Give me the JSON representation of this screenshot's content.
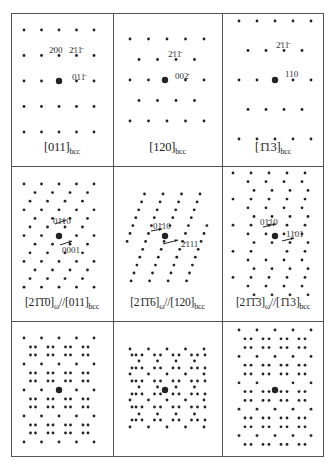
{
  "figure": {
    "frame": {
      "left": 11,
      "top": 13,
      "width": 313,
      "height": 444
    },
    "col_dividers": [
      102,
      211
    ],
    "row_dividers": [
      153,
      308
    ],
    "colors": {
      "spot": "#222222",
      "frame": "#555555",
      "text": "#222222"
    }
  },
  "panels": [
    {
      "id": "a",
      "row": 0,
      "col": 0,
      "caption": {
        "parts": [
          {
            "t": "[011]"
          },
          {
            "t": "bcc",
            "sub": true
          }
        ]
      },
      "caption_text": "[011]bcc",
      "center": [
        63,
        100
      ],
      "labels": [
        {
          "text": "2̄00",
          "x": 49,
          "y": 53
        },
        {
          "text": "2̄11̄",
          "x": 69,
          "y": 53
        },
        {
          "text": "011̄",
          "x": 72,
          "y": 80
        }
      ]
    },
    {
      "id": "b",
      "row": 0,
      "col": 1,
      "caption": {
        "parts": [
          {
            "t": "[120]"
          },
          {
            "t": "bcc",
            "sub": true
          }
        ]
      },
      "caption_text": "[120]bcc",
      "center": [
        165,
        80
      ],
      "labels": [
        {
          "text": "2̄11̄",
          "x": 168,
          "y": 57
        },
        {
          "text": "002̄",
          "x": 175,
          "y": 79
        }
      ]
    },
    {
      "id": "c",
      "row": 0,
      "col": 2,
      "caption": {
        "parts": [
          {
            "t": "[1̄13]"
          },
          {
            "t": "bcc",
            "sub": true
          }
        ]
      },
      "caption_text": "[1̄13]bcc",
      "center": [
        274,
        80
      ],
      "labels": [
        {
          "text": "2̄11̄",
          "x": 276,
          "y": 48
        },
        {
          "text": "110",
          "x": 285,
          "y": 77
        }
      ]
    },
    {
      "id": "d",
      "row": 1,
      "col": 0,
      "caption": {
        "parts": [
          {
            "t": "[21̄1̄0]"
          },
          {
            "t": "ω",
            "sub": true
          },
          {
            "t": "//[011]"
          },
          {
            "t": "bcc",
            "sub": true
          }
        ]
      },
      "caption_text": "[21̄1̄0]ω//[011]bcc",
      "labels": [
        {
          "text": "01̄10",
          "x": 53,
          "y": 224
        },
        {
          "text": "0001",
          "x": 62,
          "y": 253
        }
      ]
    },
    {
      "id": "e",
      "row": 1,
      "col": 1,
      "caption": {
        "parts": [
          {
            "t": "[21̄1̄6]"
          },
          {
            "t": "ω",
            "sub": true
          },
          {
            "t": "//[120]"
          },
          {
            "t": "bcc",
            "sub": true
          }
        ]
      },
      "caption_text": "[21̄1̄6]ω//[120]bcc",
      "labels": [
        {
          "text": "01̄10",
          "x": 153,
          "y": 229
        },
        {
          "text": "2̄111",
          "x": 181,
          "y": 247
        }
      ]
    },
    {
      "id": "f",
      "row": 1,
      "col": 2,
      "caption": {
        "parts": [
          {
            "t": "[21̄1̄3]"
          },
          {
            "t": "ω",
            "sub": true
          },
          {
            "t": "//[1̄13]"
          },
          {
            "t": "bcc",
            "sub": true
          }
        ]
      },
      "caption_text": "[21̄1̄3]ω//[1̄13]bcc",
      "labels": [
        {
          "text": "01̄10",
          "x": 260,
          "y": 225
        },
        {
          "text": "11̄01",
          "x": 286,
          "y": 237
        }
      ]
    },
    {
      "id": "g",
      "row": 2,
      "col": 0,
      "caption_text": "",
      "labels": []
    },
    {
      "id": "h",
      "row": 2,
      "col": 1,
      "caption_text": "",
      "labels": []
    },
    {
      "id": "i",
      "row": 2,
      "col": 2,
      "caption_text": "",
      "labels": []
    }
  ]
}
